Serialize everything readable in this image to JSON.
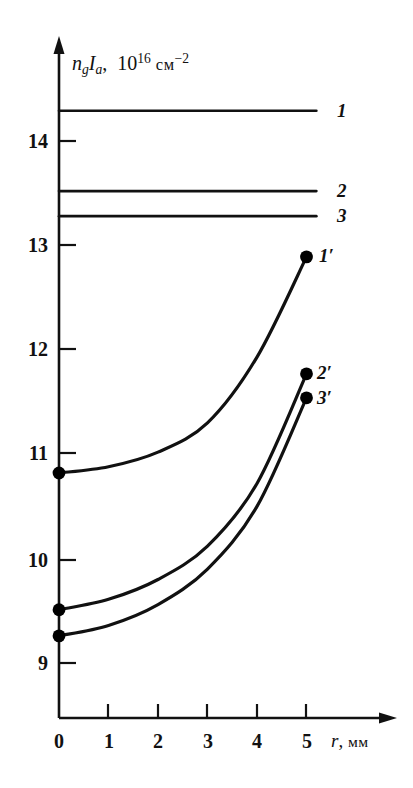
{
  "chart_data": {
    "type": "line",
    "title": "",
    "xlabel": "r, мм",
    "ylabel": "n_g I_a, 10^16 см^-2",
    "ylabel_parts": {
      "n": "n",
      "n_sub": "g",
      "I": "I",
      "I_sub": "a",
      "comma": ",",
      "base": "10",
      "exponent": "16",
      "unit": "см",
      "unit_exponent": "−2"
    },
    "xlabel_parts": {
      "symbol": "r",
      "comma": ",",
      "unit": "мм"
    },
    "xlim": [
      0,
      5.8
    ],
    "ylim": [
      8.55,
      14.65
    ],
    "xticks": [
      0,
      1,
      2,
      3,
      4,
      5
    ],
    "xticklabels": [
      "0",
      "1",
      "2",
      "3",
      "4",
      "5"
    ],
    "yticks": [
      9,
      10,
      11,
      12,
      13,
      14
    ],
    "yticklabels": [
      "9",
      "10",
      "11",
      "12",
      "13",
      "14"
    ],
    "grid": false,
    "legend": "inline-right-end-labels",
    "series": [
      {
        "name": "1",
        "label": "1",
        "style": "horizontal-line",
        "value": 14.29,
        "x": [
          0,
          5.2
        ],
        "values": [
          14.29,
          14.29
        ],
        "markers": false
      },
      {
        "name": "2",
        "label": "2",
        "style": "horizontal-line",
        "value": 13.52,
        "x": [
          0,
          5.2
        ],
        "values": [
          13.52,
          13.52
        ],
        "markers": false
      },
      {
        "name": "3",
        "label": "3",
        "style": "horizontal-line",
        "value": 13.28,
        "x": [
          0,
          5.2
        ],
        "values": [
          13.28,
          13.28
        ],
        "markers": false
      },
      {
        "name": "1'",
        "label": "1′",
        "style": "curve",
        "x": [
          0,
          1,
          2,
          3,
          4,
          5
        ],
        "values": [
          10.82,
          10.88,
          11.02,
          11.3,
          11.93,
          12.89
        ],
        "markers": true,
        "marker_points": [
          [
            0,
            10.82
          ],
          [
            5,
            12.89
          ]
        ]
      },
      {
        "name": "2'",
        "label": "2′",
        "style": "curve",
        "x": [
          0,
          1,
          2,
          3,
          4,
          5
        ],
        "values": [
          9.51,
          9.61,
          9.8,
          10.12,
          10.72,
          11.77
        ],
        "markers": true,
        "marker_points": [
          [
            0,
            9.51
          ],
          [
            5,
            11.77
          ]
        ]
      },
      {
        "name": "3'",
        "label": "3′",
        "style": "curve",
        "x": [
          0,
          1,
          2,
          3,
          4,
          5
        ],
        "values": [
          9.26,
          9.36,
          9.56,
          9.9,
          10.5,
          11.54
        ],
        "markers": true,
        "marker_points": [
          [
            0,
            9.26
          ],
          [
            5,
            11.54
          ]
        ]
      }
    ],
    "colors": {
      "line": "#111111",
      "axis": "#111111",
      "marker": "#000000",
      "background": "#ffffff"
    }
  }
}
